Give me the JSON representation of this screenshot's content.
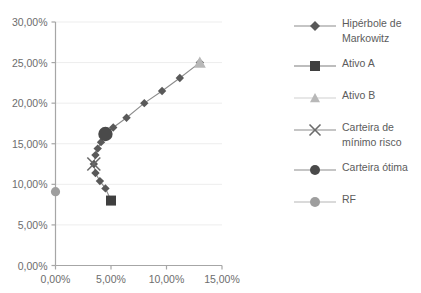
{
  "title": "",
  "chart_data": {
    "type": "scatter",
    "title": "",
    "xlabel": "",
    "ylabel": "",
    "xlim": [
      0,
      15
    ],
    "ylim": [
      0,
      30
    ],
    "grid": "horizontal",
    "legend_position": "right",
    "x_tick_labels": [
      "0,00%",
      "5,00%",
      "10,00%",
      "15,00%"
    ],
    "x_ticks": [
      0,
      5,
      10,
      15
    ],
    "y_tick_labels": [
      "0,00%",
      "5,00%",
      "10,00%",
      "15,00%",
      "20,00%",
      "25,00%",
      "30,00%"
    ],
    "y_ticks": [
      0,
      5,
      10,
      15,
      20,
      25,
      30
    ],
    "series": [
      {
        "name": "Hipérbole de Markowitz",
        "marker": "diamond",
        "color": "#595959",
        "line_color": "#8c8c8c",
        "points": [
          [
            3.45,
            12.5
          ],
          [
            3.6,
            11.4
          ],
          [
            4.0,
            10.4
          ],
          [
            4.5,
            9.5
          ],
          [
            5.0,
            8.0
          ],
          [
            3.6,
            13.6
          ],
          [
            3.8,
            14.4
          ],
          [
            4.1,
            15.2
          ],
          [
            4.5,
            16.2
          ],
          [
            5.2,
            17.0
          ],
          [
            6.4,
            18.2
          ],
          [
            8.0,
            20.0
          ],
          [
            9.6,
            21.5
          ],
          [
            11.2,
            23.1
          ],
          [
            13.0,
            25.0
          ]
        ]
      },
      {
        "name": "Ativo A",
        "marker": "square",
        "color": "#3f3f3f",
        "points": [
          [
            5.0,
            8.0
          ]
        ]
      },
      {
        "name": "Ativo B",
        "marker": "triangle",
        "color": "#b8b8b8",
        "points": [
          [
            13.0,
            25.0
          ]
        ]
      },
      {
        "name": "Carteira de\nmínimo risco",
        "marker": "x",
        "color": "#6b6b6b",
        "points": [
          [
            3.45,
            12.5
          ]
        ]
      },
      {
        "name": "Carteira ótima",
        "marker": "circle",
        "color": "#4a4a4a",
        "points": [
          [
            4.5,
            16.2
          ]
        ]
      },
      {
        "name": "RF",
        "marker": "circle",
        "color": "#9e9e9e",
        "points": [
          [
            0.0,
            9.1
          ]
        ]
      }
    ]
  },
  "legend": {
    "items": [
      {
        "label": "Hipérbole de\nMarkowitz",
        "marker": "diamond",
        "color": "#595959",
        "line": "#8c8c8c"
      },
      {
        "label": "Ativo A",
        "marker": "square",
        "color": "#3f3f3f",
        "line": "#7d7d7d"
      },
      {
        "label": "Ativo B",
        "marker": "triangle",
        "color": "#b8b8b8",
        "line": "#cfcfcf"
      },
      {
        "label": "Carteira de\nmínimo risco",
        "marker": "x",
        "color": "#6b6b6b",
        "line": "#8c8c8c"
      },
      {
        "label": "Carteira ótima",
        "marker": "circle",
        "color": "#4a4a4a",
        "line": "#8c8c8c"
      },
      {
        "label": "RF",
        "marker": "circle",
        "color": "#9e9e9e",
        "line": "#b5b5b5"
      }
    ]
  },
  "colors": {
    "axis": "#a6a6a6",
    "grid": "#ededed",
    "text": "#6d6d6d",
    "background": "#ffffff"
  }
}
